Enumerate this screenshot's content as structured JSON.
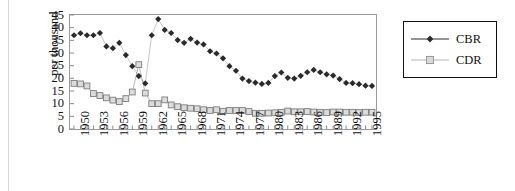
{
  "figure": {
    "background": "#ffffff",
    "frame_color": "#9a9a9a"
  },
  "legend": {
    "position": "right",
    "border_color": "#111111",
    "entries": [
      {
        "label": "CBR",
        "marker": "diamond",
        "color": "#2a2a2a",
        "line_color": "#2a2a2a"
      },
      {
        "label": "CDR",
        "marker": "square",
        "color": "#cfcfcf",
        "line_color": "#b5b5b5"
      }
    ]
  },
  "chart_data": {
    "type": "line",
    "title": "",
    "subtitle": "",
    "xlabel": "",
    "ylabel": "per thousand",
    "ylim": [
      0,
      45
    ],
    "ytick_step": 5,
    "yticks": [
      0,
      5,
      10,
      15,
      20,
      25,
      30,
      35,
      40,
      45
    ],
    "ytick_labels": [
      "0",
      "5",
      "10",
      "15",
      "20",
      "25",
      "30",
      "35",
      "40",
      "45"
    ],
    "grid": false,
    "legend_position": "right",
    "x": [
      1950,
      1951,
      1952,
      1953,
      1954,
      1955,
      1956,
      1957,
      1958,
      1959,
      1960,
      1961,
      1962,
      1963,
      1964,
      1965,
      1966,
      1967,
      1968,
      1969,
      1970,
      1971,
      1972,
      1973,
      1974,
      1975,
      1976,
      1977,
      1978,
      1979,
      1980,
      1981,
      1982,
      1983,
      1984,
      1985,
      1986,
      1987,
      1988,
      1989,
      1990,
      1991,
      1992,
      1993,
      1994,
      1995,
      1996
    ],
    "xtick_labels": [
      "1950",
      "1953",
      "1956",
      "1959",
      "1962",
      "1965",
      "1968",
      "1971",
      "1974",
      "1977",
      "1980",
      "1983",
      "1986",
      "1989",
      "1992",
      "1995"
    ],
    "xtick_step_years": 3,
    "xlim": [
      1950,
      1996
    ],
    "series": [
      {
        "name": "CBR",
        "marker": "diamond",
        "color": "#2a2a2a",
        "values": [
          37.0,
          37.8,
          37.0,
          37.0,
          37.9,
          32.6,
          31.9,
          34.0,
          29.2,
          24.8,
          20.9,
          18.0,
          37.0,
          43.4,
          39.1,
          37.9,
          35.1,
          34.0,
          35.6,
          34.1,
          33.4,
          30.7,
          29.8,
          27.9,
          24.8,
          23.0,
          19.9,
          18.9,
          18.3,
          17.8,
          18.2,
          20.9,
          22.3,
          20.2,
          19.9,
          21.0,
          22.4,
          23.3,
          22.4,
          21.6,
          21.1,
          19.7,
          18.2,
          18.1,
          17.7,
          17.1,
          17.0
        ]
      },
      {
        "name": "CDR",
        "marker": "square",
        "color": "#cfcfcf",
        "line_color": "#b5b5b5",
        "values": [
          18.0,
          17.8,
          17.0,
          14.0,
          13.2,
          12.3,
          11.4,
          10.8,
          12.0,
          14.6,
          25.4,
          14.2,
          10.0,
          10.0,
          11.5,
          9.5,
          8.8,
          8.4,
          8.2,
          8.0,
          7.6,
          7.3,
          7.6,
          7.0,
          7.3,
          7.3,
          7.3,
          6.9,
          6.2,
          6.2,
          6.3,
          6.4,
          6.6,
          7.1,
          6.8,
          6.8,
          6.9,
          6.7,
          6.6,
          6.5,
          6.7,
          6.7,
          6.6,
          6.6,
          6.5,
          6.6,
          6.6
        ]
      }
    ]
  }
}
